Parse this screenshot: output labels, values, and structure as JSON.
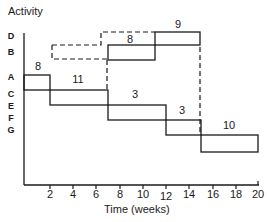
{
  "diagram": {
    "title": "Activity",
    "xlabel": "Time  (weeks)",
    "row_labels": [
      "D",
      "B",
      "A",
      "C",
      "E",
      "F",
      "G"
    ],
    "x_ticks": [
      "2",
      "4",
      "6",
      "8",
      "10",
      "12",
      "14",
      "16",
      "18",
      "20"
    ],
    "activities": [
      {
        "name": "A",
        "start": 0,
        "end": 2,
        "duration_label": "8"
      },
      {
        "name": "C",
        "start": 2,
        "end": 7,
        "duration_label": "11"
      },
      {
        "name": "E",
        "start": 7,
        "end": 12,
        "duration_label": "3"
      },
      {
        "name": "F",
        "start": 12,
        "end": 15,
        "duration_label": "3"
      },
      {
        "name": "G",
        "start": 15,
        "end": 20,
        "duration_label": "10"
      },
      {
        "name": "B",
        "start": 7,
        "end": 11,
        "duration_label": "8"
      },
      {
        "name": "D",
        "start": 11,
        "end": 15,
        "duration_label": "9"
      }
    ],
    "line_color": "#1a1a1a"
  }
}
